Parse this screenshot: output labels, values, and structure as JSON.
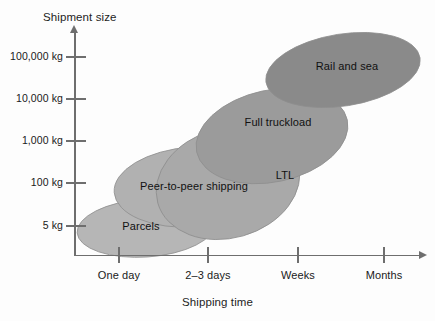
{
  "chart_data": {
    "type": "scatter",
    "title": "",
    "xlabel": "Shipping time",
    "ylabel": "Shipment size",
    "grid": false,
    "legend": "none",
    "x_ticks": [
      "One day",
      "2–3 days",
      "Weeks",
      "Months"
    ],
    "y_ticks": [
      "100,000 kg",
      "10,000 kg",
      "1,000 kg",
      "100 kg",
      "5 kg"
    ],
    "y_scale": "log",
    "series": [
      {
        "name": "Parcels",
        "label": "Parcels",
        "color": "#b6b6b6",
        "shape": "ellipse",
        "x_range": [
          "before one day",
          "just past one day"
        ],
        "y_range": [
          "below 5 kg",
          "about 100 kg"
        ],
        "cx": 146,
        "cy": 228,
        "rx": 69,
        "ry": 29,
        "rotation": -4
      },
      {
        "name": "Peer-to-peer shipping",
        "label": "Peer-to-peer shipping",
        "color": "#b1b1b1",
        "shape": "ellipse",
        "x_range": [
          "one day",
          "2–3 days"
        ],
        "y_range": [
          "about 20 kg",
          "about 1,000 kg"
        ],
        "cx": 193,
        "cy": 187,
        "rx": 79,
        "ry": 40,
        "rotation": -4
      },
      {
        "name": "LTL",
        "label": "LTL",
        "color": "#a9a9a9",
        "shape": "ellipse",
        "x_range": [
          "one day",
          "weeks"
        ],
        "y_range": [
          "about 50 kg",
          "about 3,000 kg"
        ],
        "cx": 228,
        "cy": 183,
        "rx": 73,
        "ry": 55,
        "rotation": -16
      },
      {
        "name": "Full truckload",
        "label": "Full truckload",
        "color": "#9b9b9b",
        "shape": "ellipse",
        "x_range": [
          "2–3 days",
          "weeks"
        ],
        "y_range": [
          "about 1,000 kg",
          "about 30,000 kg"
        ],
        "cx": 272,
        "cy": 136,
        "rx": 77,
        "ry": 46,
        "rotation": -12
      },
      {
        "name": "Rail and sea",
        "label": "Rail and sea",
        "color": "#8a8a8a",
        "shape": "ellipse",
        "x_range": [
          "weeks",
          "months"
        ],
        "y_range": [
          "about 10,000 kg",
          "above 100,000 kg"
        ],
        "cx": 343,
        "cy": 70,
        "rx": 78,
        "ry": 36,
        "rotation": -9
      }
    ]
  },
  "axes": {
    "y": {
      "title": "Shipment size",
      "ticks": [
        {
          "label": "100,000 kg",
          "y": 57
        },
        {
          "label": "10,000 kg",
          "y": 99
        },
        {
          "label": "1,000 kg",
          "y": 141
        },
        {
          "label": "100 kg",
          "y": 183
        },
        {
          "label": "5 kg",
          "y": 226
        }
      ]
    },
    "x": {
      "title": "Shipping time",
      "ticks": [
        {
          "label": "One day",
          "x": 119
        },
        {
          "label": "2–3 days",
          "x": 208
        },
        {
          "label": "Weeks",
          "x": 298
        },
        {
          "label": "Months",
          "x": 384
        }
      ]
    }
  },
  "colors": {
    "axis": "#6e6e6e",
    "text": "#1a1a1a",
    "background": "#fdfdfd"
  }
}
